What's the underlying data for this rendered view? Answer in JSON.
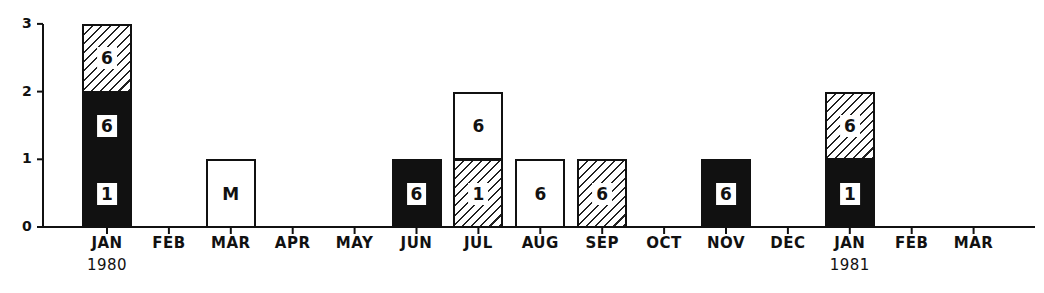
{
  "chart_data": {
    "type": "bar",
    "stacked": true,
    "title": "",
    "xlabel": "",
    "ylabel": "",
    "ylim": [
      0,
      3
    ],
    "yticks": [
      "0",
      "1",
      "2",
      "3"
    ],
    "grid": false,
    "legend": null,
    "categories": [
      "JAN 1980",
      "FEB",
      "MAR",
      "APR",
      "MAY",
      "JUN",
      "JUL",
      "AUG",
      "SEP",
      "OCT",
      "NOV",
      "DEC",
      "JAN 1981",
      "FEB",
      "MAR"
    ],
    "tick_labels": [
      {
        "line1": "JAN",
        "line2": "1980"
      },
      {
        "line1": "FEB",
        "line2": ""
      },
      {
        "line1": "MAR",
        "line2": ""
      },
      {
        "line1": "APR",
        "line2": ""
      },
      {
        "line1": "MAY",
        "line2": ""
      },
      {
        "line1": "JUN",
        "line2": ""
      },
      {
        "line1": "JUL",
        "line2": ""
      },
      {
        "line1": "AUG",
        "line2": ""
      },
      {
        "line1": "SEP",
        "line2": ""
      },
      {
        "line1": "OCT",
        "line2": ""
      },
      {
        "line1": "NOV",
        "line2": ""
      },
      {
        "line1": "DEC",
        "line2": ""
      },
      {
        "line1": "JAN",
        "line2": "1981"
      },
      {
        "line1": "FEB",
        "line2": ""
      },
      {
        "line1": "MAR",
        "line2": ""
      }
    ],
    "series": [
      {
        "name": "solid (black)",
        "values": [
          2,
          0,
          0,
          0,
          0,
          1,
          0,
          0,
          0,
          0,
          1,
          0,
          1,
          0,
          0
        ]
      },
      {
        "name": "hatched",
        "values": [
          1,
          0,
          0,
          0,
          0,
          0,
          1,
          0,
          1,
          0,
          0,
          0,
          1,
          0,
          0
        ]
      },
      {
        "name": "open (white)",
        "values": [
          0,
          0,
          1,
          0,
          0,
          0,
          1,
          1,
          0,
          0,
          0,
          0,
          0,
          0,
          0
        ]
      }
    ],
    "bars": [
      {
        "index": 0,
        "segments": [
          {
            "fill": "solid",
            "value": 1,
            "label": "1"
          },
          {
            "fill": "solid",
            "value": 1,
            "label": "6"
          },
          {
            "fill": "hatched",
            "value": 1,
            "label": "6"
          }
        ]
      },
      {
        "index": 2,
        "segments": [
          {
            "fill": "open",
            "value": 1,
            "label": "M"
          }
        ]
      },
      {
        "index": 5,
        "segments": [
          {
            "fill": "solid",
            "value": 1,
            "label": "6"
          }
        ]
      },
      {
        "index": 6,
        "segments": [
          {
            "fill": "hatched",
            "value": 1,
            "label": "1"
          },
          {
            "fill": "open",
            "value": 1,
            "label": "6"
          }
        ]
      },
      {
        "index": 7,
        "segments": [
          {
            "fill": "open",
            "value": 1,
            "label": "6"
          }
        ]
      },
      {
        "index": 8,
        "segments": [
          {
            "fill": "hatched",
            "value": 1,
            "label": "6"
          }
        ]
      },
      {
        "index": 10,
        "segments": [
          {
            "fill": "solid",
            "value": 1,
            "label": "6"
          }
        ]
      },
      {
        "index": 12,
        "segments": [
          {
            "fill": "solid",
            "value": 1,
            "label": "1"
          },
          {
            "fill": "hatched",
            "value": 1,
            "label": "6"
          }
        ]
      }
    ],
    "colors": {
      "ink": "#111111",
      "background": "#ffffff"
    }
  }
}
